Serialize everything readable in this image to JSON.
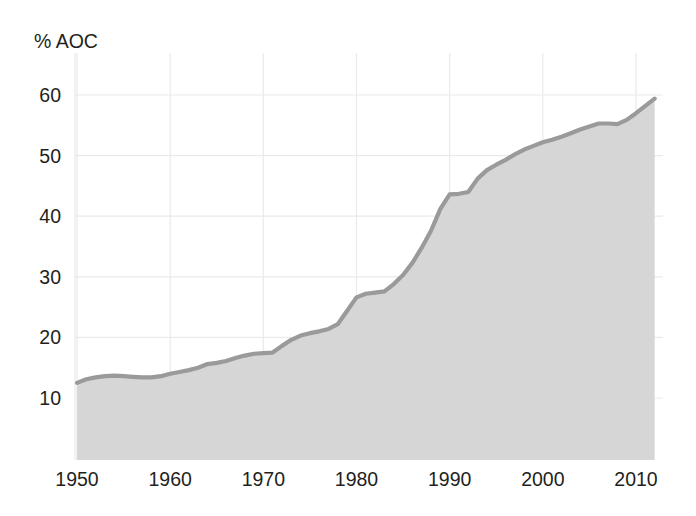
{
  "chart_data": {
    "type": "area",
    "title": "",
    "subtitle": "",
    "xlabel": "",
    "ylabel": "% AOC",
    "ylabel_position": "top-left",
    "xlim": [
      1950,
      2012
    ],
    "ylim": [
      0,
      63
    ],
    "grid": true,
    "grid_color": "#e9eaec",
    "legend": "none",
    "line_color": "#9a9a9a",
    "fill_color": "#d6d6d6",
    "background_color": "#ffffff",
    "x_ticks": [
      1950,
      1960,
      1970,
      1980,
      1990,
      2000,
      2010
    ],
    "x_tick_labels": [
      "1950",
      "1960",
      "1970",
      "1980",
      "1990",
      "2000",
      "2010"
    ],
    "y_ticks": [
      10,
      20,
      30,
      40,
      50,
      60
    ],
    "y_tick_labels": [
      "10",
      "20",
      "30",
      "40",
      "50",
      "60"
    ],
    "series": [
      {
        "name": "% AOC",
        "x": [
          1950,
          1951,
          1952,
          1953,
          1954,
          1955,
          1956,
          1957,
          1958,
          1959,
          1960,
          1961,
          1962,
          1963,
          1964,
          1965,
          1966,
          1967,
          1968,
          1969,
          1970,
          1971,
          1972,
          1973,
          1974,
          1975,
          1976,
          1977,
          1978,
          1979,
          1980,
          1981,
          1982,
          1983,
          1984,
          1985,
          1986,
          1987,
          1988,
          1989,
          1990,
          1991,
          1992,
          1993,
          1994,
          1995,
          1996,
          1997,
          1998,
          1999,
          2000,
          2001,
          2002,
          2003,
          2004,
          2005,
          2006,
          2007,
          2008,
          2009,
          2010,
          2011,
          2012
        ],
        "values": [
          12.5,
          13.1,
          13.4,
          13.6,
          13.7,
          13.6,
          13.5,
          13.4,
          13.4,
          13.6,
          14.0,
          14.3,
          14.6,
          15.0,
          15.6,
          15.8,
          16.1,
          16.6,
          17.0,
          17.3,
          17.4,
          17.5,
          18.6,
          19.6,
          20.3,
          20.7,
          21.0,
          21.4,
          22.2,
          24.4,
          26.6,
          27.2,
          27.4,
          27.6,
          28.8,
          30.3,
          32.3,
          34.8,
          37.6,
          41.2,
          43.6,
          43.7,
          44.0,
          46.2,
          47.6,
          48.5,
          49.3,
          50.2,
          51.0,
          51.6,
          52.2,
          52.6,
          53.1,
          53.7,
          54.3,
          54.8,
          55.3,
          55.3,
          55.2,
          55.9,
          57.0,
          58.2,
          59.4
        ]
      }
    ]
  },
  "axis": {
    "y_axis_title": "% AOC"
  }
}
